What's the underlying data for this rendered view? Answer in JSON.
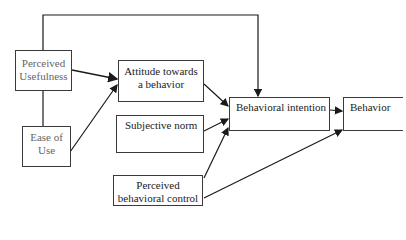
{
  "diagram": {
    "type": "flowchart",
    "nodes": {
      "perceived_usefulness": [
        "Perceived",
        "Usefulness"
      ],
      "ease_of_use": [
        "Ease of",
        "Use"
      ],
      "attitude": [
        "Attitude towards",
        "a behavior"
      ],
      "subjective_norm": [
        "Subjective norm"
      ],
      "perceived_behavioral_control": [
        "Perceived",
        "behavioral control"
      ],
      "behavioral_intention": [
        "Behavioral intention"
      ],
      "behavior": [
        "Behavior"
      ]
    },
    "edges": [
      {
        "from": "perceived_usefulness",
        "to": "attitude"
      },
      {
        "from": "ease_of_use",
        "to": "attitude"
      },
      {
        "from": "ease_of_use",
        "to": "perceived_usefulness"
      },
      {
        "from": "perceived_usefulness",
        "to": "behavioral_intention"
      },
      {
        "from": "attitude",
        "to": "behavioral_intention"
      },
      {
        "from": "subjective_norm",
        "to": "behavioral_intention"
      },
      {
        "from": "perceived_behavioral_control",
        "to": "behavioral_intention"
      },
      {
        "from": "perceived_behavioral_control",
        "to": "behavior"
      },
      {
        "from": "behavioral_intention",
        "to": "behavior"
      }
    ],
    "line_color": "#1a1a1a"
  }
}
